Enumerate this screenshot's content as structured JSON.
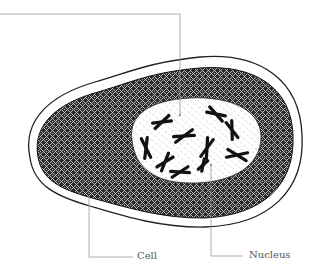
{
  "figure": {
    "labels": {
      "cell": "Cell",
      "nucleus": "Nucleus"
    },
    "chromosome_count": 10,
    "colors": {
      "outline": "#222222",
      "cytoplasm": "#1a1a1a",
      "leader": "#9a9a9a",
      "label": "#555555",
      "background": "#ffffff"
    }
  }
}
